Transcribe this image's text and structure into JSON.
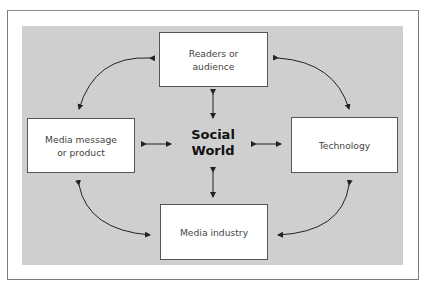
{
  "diagram": {
    "center_label_line1": "Social",
    "center_label_line2": "World",
    "nodes": {
      "top": {
        "line1": "Readers or",
        "line2": "audience"
      },
      "left": {
        "line1": "Media message",
        "line2": "or product"
      },
      "right": {
        "line1": "Technology"
      },
      "bottom": {
        "line1": "Media industry"
      }
    },
    "colors": {
      "panel": "#cfcfcf",
      "box": "#ffffff",
      "arrow": "#222222"
    }
  }
}
